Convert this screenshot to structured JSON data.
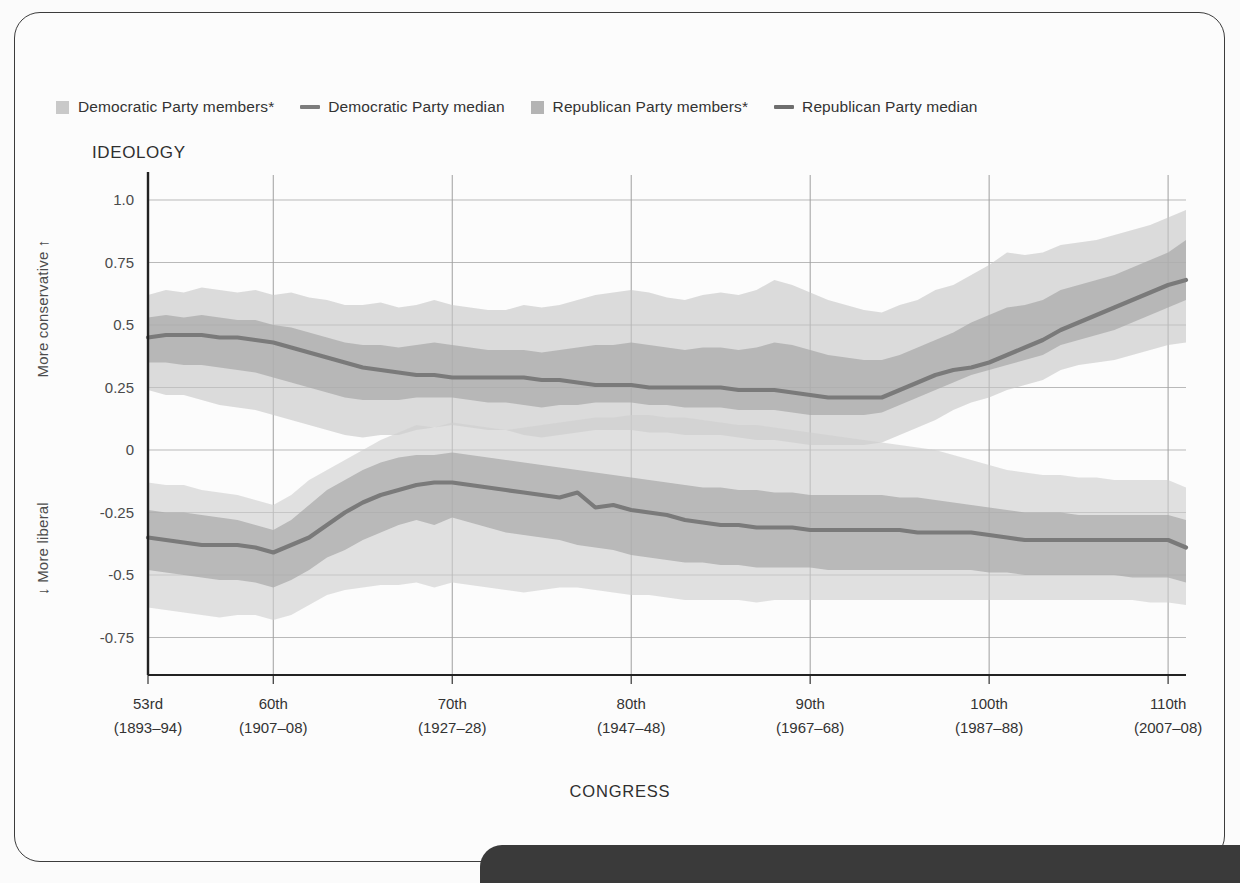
{
  "legend": {
    "items": [
      {
        "label": "Democratic Party members*",
        "kind": "swatch",
        "color": "#c9c9c9"
      },
      {
        "label": "Democratic Party median",
        "kind": "line",
        "color": "#7d7d7d"
      },
      {
        "label": "Republican Party members*",
        "kind": "swatch",
        "color": "#b4b4b4"
      },
      {
        "label": "Republican Party median",
        "kind": "line",
        "color": "#6e6e6e"
      }
    ]
  },
  "titles": {
    "ideology": "IDEOLOGY",
    "y_upper": "More conservative  ↑",
    "y_lower": "↓  More liberal",
    "x_axis": "CONGRESS"
  },
  "chart_data": {
    "type": "area",
    "title": "IDEOLOGY",
    "xlabel": "CONGRESS",
    "ylabel": "IDEOLOGY",
    "ylim": [
      -0.9,
      1.08
    ],
    "xlim": [
      53,
      111
    ],
    "grid": true,
    "legend_position": "top",
    "yticks": [
      "1.0",
      "0.75",
      "0.5",
      "0.25",
      "0",
      "-0.25",
      "-0.5",
      "-0.75"
    ],
    "ytick_values": [
      1.0,
      0.75,
      0.5,
      0.25,
      0,
      -0.25,
      -0.5,
      -0.75
    ],
    "xticks": [
      {
        "congress": 53,
        "label": "53rd",
        "years": "(1893–94)"
      },
      {
        "congress": 60,
        "label": "60th",
        "years": "(1907–08)"
      },
      {
        "congress": 70,
        "label": "70th",
        "years": "(1927–28)"
      },
      {
        "congress": 80,
        "label": "80th",
        "years": "(1947–48)"
      },
      {
        "congress": 90,
        "label": "90th",
        "years": "(1967–68)"
      },
      {
        "congress": 100,
        "label": "100th",
        "years": "(1987–88)"
      },
      {
        "congress": 110,
        "label": "110th",
        "years": "(2007–08)"
      }
    ],
    "x": [
      53,
      54,
      55,
      56,
      57,
      58,
      59,
      60,
      61,
      62,
      63,
      64,
      65,
      66,
      67,
      68,
      69,
      70,
      71,
      72,
      73,
      74,
      75,
      76,
      77,
      78,
      79,
      80,
      81,
      82,
      83,
      84,
      85,
      86,
      87,
      88,
      89,
      90,
      91,
      92,
      73,
      94,
      95,
      96,
      97,
      98,
      99,
      100,
      101,
      102,
      103,
      104,
      105,
      106,
      107,
      108,
      109,
      110,
      111
    ],
    "series": [
      {
        "name": "Republican Party members*",
        "role": "outer_band_republican",
        "color": "#c6c6c6",
        "upper": [
          0.62,
          0.64,
          0.63,
          0.65,
          0.64,
          0.63,
          0.64,
          0.62,
          0.63,
          0.61,
          0.6,
          0.58,
          0.58,
          0.59,
          0.57,
          0.58,
          0.6,
          0.58,
          0.57,
          0.56,
          0.56,
          0.58,
          0.57,
          0.58,
          0.6,
          0.62,
          0.63,
          0.64,
          0.63,
          0.61,
          0.6,
          0.62,
          0.63,
          0.62,
          0.64,
          0.68,
          0.66,
          0.63,
          0.6,
          0.58,
          0.56,
          0.55,
          0.58,
          0.6,
          0.64,
          0.66,
          0.7,
          0.74,
          0.79,
          0.78,
          0.79,
          0.82,
          0.83,
          0.84,
          0.86,
          0.88,
          0.9,
          0.93,
          0.96
        ],
        "lower": [
          0.24,
          0.22,
          0.22,
          0.2,
          0.18,
          0.17,
          0.16,
          0.14,
          0.12,
          0.1,
          0.08,
          0.06,
          0.05,
          0.06,
          0.06,
          0.08,
          0.09,
          0.1,
          0.09,
          0.08,
          0.08,
          0.06,
          0.05,
          0.06,
          0.07,
          0.08,
          0.08,
          0.08,
          0.07,
          0.07,
          0.06,
          0.06,
          0.06,
          0.05,
          0.04,
          0.04,
          0.03,
          0.02,
          0.02,
          0.02,
          0.02,
          0.03,
          0.06,
          0.09,
          0.12,
          0.16,
          0.19,
          0.21,
          0.24,
          0.26,
          0.28,
          0.32,
          0.34,
          0.35,
          0.36,
          0.38,
          0.4,
          0.42,
          0.43
        ]
      },
      {
        "name": "Republican Party members inner",
        "role": "inner_band_republican",
        "color": "#a9a9a9",
        "upper": [
          0.53,
          0.54,
          0.53,
          0.54,
          0.53,
          0.52,
          0.52,
          0.5,
          0.49,
          0.47,
          0.45,
          0.43,
          0.42,
          0.42,
          0.41,
          0.42,
          0.43,
          0.42,
          0.41,
          0.4,
          0.4,
          0.4,
          0.39,
          0.4,
          0.41,
          0.42,
          0.42,
          0.43,
          0.42,
          0.41,
          0.4,
          0.41,
          0.41,
          0.4,
          0.41,
          0.43,
          0.42,
          0.4,
          0.38,
          0.37,
          0.36,
          0.36,
          0.38,
          0.41,
          0.44,
          0.47,
          0.51,
          0.54,
          0.57,
          0.58,
          0.6,
          0.64,
          0.66,
          0.68,
          0.7,
          0.73,
          0.76,
          0.79,
          0.84
        ],
        "lower": [
          0.35,
          0.35,
          0.34,
          0.34,
          0.33,
          0.32,
          0.31,
          0.29,
          0.27,
          0.25,
          0.23,
          0.21,
          0.2,
          0.2,
          0.2,
          0.21,
          0.21,
          0.21,
          0.2,
          0.19,
          0.19,
          0.18,
          0.17,
          0.18,
          0.18,
          0.19,
          0.19,
          0.19,
          0.18,
          0.18,
          0.17,
          0.17,
          0.17,
          0.16,
          0.16,
          0.16,
          0.15,
          0.14,
          0.14,
          0.14,
          0.14,
          0.15,
          0.18,
          0.21,
          0.24,
          0.27,
          0.3,
          0.32,
          0.34,
          0.36,
          0.38,
          0.42,
          0.44,
          0.46,
          0.48,
          0.51,
          0.54,
          0.57,
          0.6
        ]
      },
      {
        "name": "Republican Party median",
        "role": "median_republican",
        "color": "#7a7a7a",
        "values": [
          0.45,
          0.46,
          0.46,
          0.46,
          0.45,
          0.45,
          0.44,
          0.43,
          0.41,
          0.39,
          0.37,
          0.35,
          0.33,
          0.32,
          0.31,
          0.3,
          0.3,
          0.29,
          0.29,
          0.29,
          0.29,
          0.29,
          0.28,
          0.28,
          0.27,
          0.26,
          0.26,
          0.26,
          0.25,
          0.25,
          0.25,
          0.25,
          0.25,
          0.24,
          0.24,
          0.24,
          0.23,
          0.22,
          0.21,
          0.21,
          0.21,
          0.21,
          0.24,
          0.27,
          0.3,
          0.32,
          0.33,
          0.35,
          0.38,
          0.41,
          0.44,
          0.48,
          0.51,
          0.54,
          0.57,
          0.6,
          0.63,
          0.66,
          0.68
        ]
      },
      {
        "name": "Democratic Party members*",
        "role": "outer_band_democratic",
        "color": "#cfcfcf",
        "upper": [
          -0.13,
          -0.14,
          -0.14,
          -0.16,
          -0.17,
          -0.18,
          -0.2,
          -0.22,
          -0.18,
          -0.12,
          -0.08,
          -0.04,
          0.0,
          0.04,
          0.07,
          0.1,
          0.09,
          0.11,
          0.1,
          0.09,
          0.08,
          0.09,
          0.1,
          0.11,
          0.12,
          0.13,
          0.13,
          0.14,
          0.14,
          0.13,
          0.13,
          0.12,
          0.11,
          0.1,
          0.1,
          0.09,
          0.08,
          0.07,
          0.06,
          0.05,
          0.04,
          0.03,
          0.02,
          0.01,
          0.0,
          -0.02,
          -0.04,
          -0.06,
          -0.08,
          -0.09,
          -0.1,
          -0.1,
          -0.11,
          -0.11,
          -0.12,
          -0.12,
          -0.12,
          -0.12,
          -0.15
        ],
        "lower": [
          -0.63,
          -0.64,
          -0.65,
          -0.66,
          -0.67,
          -0.66,
          -0.66,
          -0.68,
          -0.66,
          -0.62,
          -0.58,
          -0.56,
          -0.55,
          -0.54,
          -0.54,
          -0.53,
          -0.55,
          -0.53,
          -0.54,
          -0.55,
          -0.56,
          -0.57,
          -0.56,
          -0.55,
          -0.55,
          -0.56,
          -0.57,
          -0.58,
          -0.58,
          -0.59,
          -0.6,
          -0.6,
          -0.6,
          -0.6,
          -0.61,
          -0.6,
          -0.6,
          -0.6,
          -0.6,
          -0.6,
          -0.6,
          -0.6,
          -0.6,
          -0.6,
          -0.6,
          -0.6,
          -0.6,
          -0.6,
          -0.6,
          -0.6,
          -0.6,
          -0.6,
          -0.6,
          -0.6,
          -0.6,
          -0.6,
          -0.61,
          -0.61,
          -0.62
        ]
      },
      {
        "name": "Democratic Party members inner",
        "role": "inner_band_democratic",
        "color": "#a9a9a9",
        "upper": [
          -0.24,
          -0.25,
          -0.25,
          -0.26,
          -0.27,
          -0.28,
          -0.3,
          -0.32,
          -0.28,
          -0.22,
          -0.16,
          -0.12,
          -0.08,
          -0.05,
          -0.03,
          -0.02,
          -0.02,
          -0.01,
          -0.02,
          -0.03,
          -0.04,
          -0.05,
          -0.06,
          -0.07,
          -0.08,
          -0.09,
          -0.1,
          -0.11,
          -0.12,
          -0.13,
          -0.14,
          -0.15,
          -0.15,
          -0.16,
          -0.16,
          -0.17,
          -0.17,
          -0.18,
          -0.18,
          -0.18,
          -0.18,
          -0.18,
          -0.19,
          -0.19,
          -0.2,
          -0.21,
          -0.22,
          -0.23,
          -0.24,
          -0.25,
          -0.25,
          -0.25,
          -0.26,
          -0.26,
          -0.26,
          -0.26,
          -0.26,
          -0.26,
          -0.28
        ],
        "lower": [
          -0.48,
          -0.49,
          -0.5,
          -0.51,
          -0.52,
          -0.52,
          -0.53,
          -0.55,
          -0.52,
          -0.48,
          -0.43,
          -0.4,
          -0.36,
          -0.33,
          -0.3,
          -0.28,
          -0.3,
          -0.27,
          -0.29,
          -0.31,
          -0.33,
          -0.34,
          -0.35,
          -0.36,
          -0.38,
          -0.39,
          -0.4,
          -0.42,
          -0.43,
          -0.44,
          -0.45,
          -0.45,
          -0.46,
          -0.46,
          -0.47,
          -0.47,
          -0.47,
          -0.47,
          -0.48,
          -0.48,
          -0.48,
          -0.48,
          -0.48,
          -0.48,
          -0.48,
          -0.48,
          -0.48,
          -0.49,
          -0.49,
          -0.5,
          -0.5,
          -0.5,
          -0.5,
          -0.5,
          -0.5,
          -0.51,
          -0.51,
          -0.51,
          -0.53
        ]
      },
      {
        "name": "Democratic Party median",
        "role": "median_democratic",
        "color": "#7a7a7a",
        "values": [
          -0.35,
          -0.36,
          -0.37,
          -0.38,
          -0.38,
          -0.38,
          -0.39,
          -0.41,
          -0.38,
          -0.35,
          -0.3,
          -0.25,
          -0.21,
          -0.18,
          -0.16,
          -0.14,
          -0.13,
          -0.13,
          -0.14,
          -0.15,
          -0.16,
          -0.17,
          -0.18,
          -0.19,
          -0.17,
          -0.23,
          -0.22,
          -0.24,
          -0.25,
          -0.26,
          -0.28,
          -0.29,
          -0.3,
          -0.3,
          -0.31,
          -0.31,
          -0.31,
          -0.32,
          -0.32,
          -0.32,
          -0.32,
          -0.32,
          -0.32,
          -0.33,
          -0.33,
          -0.33,
          -0.33,
          -0.34,
          -0.35,
          -0.36,
          -0.36,
          -0.36,
          -0.36,
          -0.36,
          -0.36,
          -0.36,
          -0.36,
          -0.36,
          -0.39
        ]
      }
    ]
  }
}
